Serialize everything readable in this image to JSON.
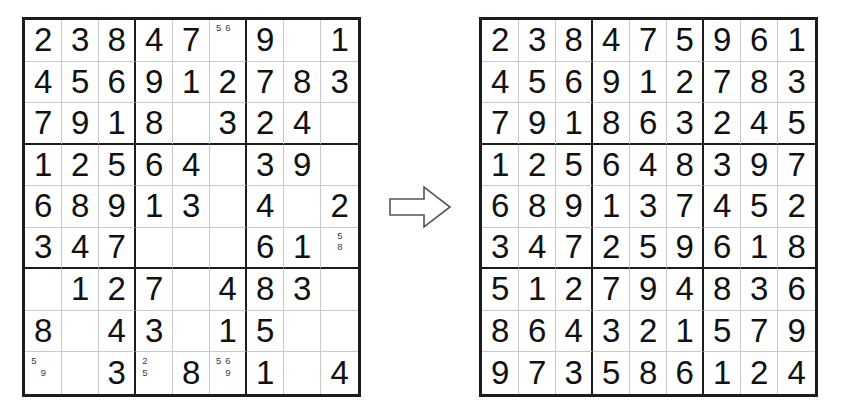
{
  "page": {
    "background_color": "#ffffff",
    "ink_color": "#111111",
    "grid_line_color": "#c9c9c9",
    "box_line_color": "#1c1c1c",
    "candidate_color": "#3a3a3a"
  },
  "arrow": {
    "name": "right-arrow",
    "direction": "right",
    "style": "outlined block arrow",
    "stroke_color": "#555555",
    "fill_color": "#ffffff"
  },
  "puzzle": {
    "label": "Sudoku puzzle (partially filled with candidate pencil marks)",
    "cells": [
      [
        {
          "value": "2"
        },
        {
          "value": "3"
        },
        {
          "value": "8"
        },
        {
          "value": "4"
        },
        {
          "value": "7"
        },
        {
          "value": "",
          "candidates": [
            "5",
            "6"
          ],
          "candidate_positions": [
            1,
            2
          ]
        },
        {
          "value": "9"
        },
        {
          "value": ""
        },
        {
          "value": "1"
        }
      ],
      [
        {
          "value": "4"
        },
        {
          "value": "5"
        },
        {
          "value": "6"
        },
        {
          "value": "9"
        },
        {
          "value": "1"
        },
        {
          "value": "2"
        },
        {
          "value": "7"
        },
        {
          "value": "8"
        },
        {
          "value": "3"
        }
      ],
      [
        {
          "value": "7"
        },
        {
          "value": "9"
        },
        {
          "value": "1"
        },
        {
          "value": "8"
        },
        {
          "value": ""
        },
        {
          "value": "3"
        },
        {
          "value": "2"
        },
        {
          "value": "4"
        },
        {
          "value": ""
        }
      ],
      [
        {
          "value": "1"
        },
        {
          "value": "2"
        },
        {
          "value": "5"
        },
        {
          "value": "6"
        },
        {
          "value": "4"
        },
        {
          "value": ""
        },
        {
          "value": "3"
        },
        {
          "value": "9"
        },
        {
          "value": ""
        }
      ],
      [
        {
          "value": "6"
        },
        {
          "value": "8"
        },
        {
          "value": "9"
        },
        {
          "value": "1"
        },
        {
          "value": "3"
        },
        {
          "value": ""
        },
        {
          "value": "4"
        },
        {
          "value": ""
        },
        {
          "value": "2"
        }
      ],
      [
        {
          "value": "3"
        },
        {
          "value": "4"
        },
        {
          "value": "7"
        },
        {
          "value": ""
        },
        {
          "value": ""
        },
        {
          "value": ""
        },
        {
          "value": "6"
        },
        {
          "value": "1"
        },
        {
          "value": "",
          "candidates": [
            "5",
            "8"
          ],
          "candidate_positions": [
            2,
            5
          ]
        }
      ],
      [
        {
          "value": ""
        },
        {
          "value": "1"
        },
        {
          "value": "2"
        },
        {
          "value": "7"
        },
        {
          "value": ""
        },
        {
          "value": "4"
        },
        {
          "value": "8"
        },
        {
          "value": "3"
        },
        {
          "value": ""
        }
      ],
      [
        {
          "value": "8"
        },
        {
          "value": ""
        },
        {
          "value": "4"
        },
        {
          "value": "3"
        },
        {
          "value": ""
        },
        {
          "value": "1"
        },
        {
          "value": "5"
        },
        {
          "value": ""
        },
        {
          "value": ""
        }
      ],
      [
        {
          "value": "",
          "candidates": [
            "5",
            "9"
          ],
          "candidate_positions": [
            1,
            5
          ]
        },
        {
          "value": ""
        },
        {
          "value": "3"
        },
        {
          "value": "",
          "candidates": [
            "2",
            "5"
          ],
          "candidate_positions": [
            1,
            4
          ]
        },
        {
          "value": "8"
        },
        {
          "value": "",
          "candidates": [
            "5",
            "6",
            "9"
          ],
          "candidate_positions": [
            1,
            2,
            5
          ]
        },
        {
          "value": "1"
        },
        {
          "value": ""
        },
        {
          "value": "4"
        }
      ]
    ]
  },
  "solution": {
    "label": "Solved sudoku grid",
    "cells": [
      [
        {
          "value": "2"
        },
        {
          "value": "3"
        },
        {
          "value": "8"
        },
        {
          "value": "4"
        },
        {
          "value": "7"
        },
        {
          "value": "5"
        },
        {
          "value": "9"
        },
        {
          "value": "6"
        },
        {
          "value": "1"
        }
      ],
      [
        {
          "value": "4"
        },
        {
          "value": "5"
        },
        {
          "value": "6"
        },
        {
          "value": "9"
        },
        {
          "value": "1"
        },
        {
          "value": "2"
        },
        {
          "value": "7"
        },
        {
          "value": "8"
        },
        {
          "value": "3"
        }
      ],
      [
        {
          "value": "7"
        },
        {
          "value": "9"
        },
        {
          "value": "1"
        },
        {
          "value": "8"
        },
        {
          "value": "6"
        },
        {
          "value": "3"
        },
        {
          "value": "2"
        },
        {
          "value": "4"
        },
        {
          "value": "5"
        }
      ],
      [
        {
          "value": "1"
        },
        {
          "value": "2"
        },
        {
          "value": "5"
        },
        {
          "value": "6"
        },
        {
          "value": "4"
        },
        {
          "value": "8"
        },
        {
          "value": "3"
        },
        {
          "value": "9"
        },
        {
          "value": "7"
        }
      ],
      [
        {
          "value": "6"
        },
        {
          "value": "8"
        },
        {
          "value": "9"
        },
        {
          "value": "1"
        },
        {
          "value": "3"
        },
        {
          "value": "7"
        },
        {
          "value": "4"
        },
        {
          "value": "5"
        },
        {
          "value": "2"
        }
      ],
      [
        {
          "value": "3"
        },
        {
          "value": "4"
        },
        {
          "value": "7"
        },
        {
          "value": "2"
        },
        {
          "value": "5"
        },
        {
          "value": "9"
        },
        {
          "value": "6"
        },
        {
          "value": "1"
        },
        {
          "value": "8"
        }
      ],
      [
        {
          "value": "5"
        },
        {
          "value": "1"
        },
        {
          "value": "2"
        },
        {
          "value": "7"
        },
        {
          "value": "9"
        },
        {
          "value": "4"
        },
        {
          "value": "8"
        },
        {
          "value": "3"
        },
        {
          "value": "6"
        }
      ],
      [
        {
          "value": "8"
        },
        {
          "value": "6"
        },
        {
          "value": "4"
        },
        {
          "value": "3"
        },
        {
          "value": "2"
        },
        {
          "value": "1"
        },
        {
          "value": "5"
        },
        {
          "value": "7"
        },
        {
          "value": "9"
        }
      ],
      [
        {
          "value": "9"
        },
        {
          "value": "7"
        },
        {
          "value": "3"
        },
        {
          "value": "5"
        },
        {
          "value": "8"
        },
        {
          "value": "6"
        },
        {
          "value": "1"
        },
        {
          "value": "2"
        },
        {
          "value": "4"
        }
      ]
    ]
  }
}
